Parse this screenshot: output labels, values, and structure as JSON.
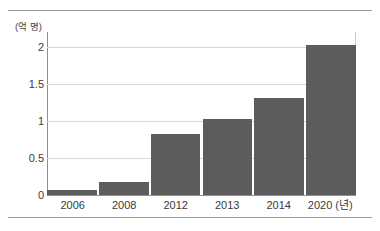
{
  "figure": {
    "unit_label": "(억 명)",
    "x_axis_unit": "(년)"
  },
  "chart_data": {
    "type": "bar",
    "title": "",
    "xlabel": "(년)",
    "ylabel": "(억 명)",
    "categories": [
      "2006",
      "2008",
      "2012",
      "2013",
      "2014",
      "2020"
    ],
    "values": [
      0.07,
      0.17,
      0.83,
      1.02,
      1.31,
      2.03
    ],
    "ylim": [
      0,
      2.2
    ],
    "yticks": [
      0,
      0.5,
      1,
      1.5,
      2
    ],
    "ytick_labels": [
      "0",
      "0.5",
      "1",
      "1.5",
      "2"
    ],
    "grid": true,
    "legend": "none",
    "bar_color": "#5c5c5c",
    "gridline_color": "#d8d8d8",
    "axis_color": "#8f8f8f"
  }
}
